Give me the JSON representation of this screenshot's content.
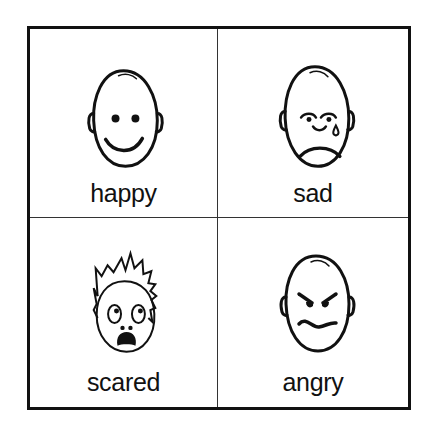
{
  "cards": [
    {
      "label": "happy",
      "icon": "happy-face-icon"
    },
    {
      "label": "sad",
      "icon": "sad-face-icon"
    },
    {
      "label": "scared",
      "icon": "scared-face-icon"
    },
    {
      "label": "angry",
      "icon": "angry-face-icon"
    }
  ],
  "colors": {
    "ink": "#111111",
    "background": "#ffffff"
  }
}
